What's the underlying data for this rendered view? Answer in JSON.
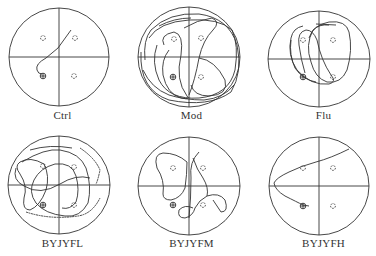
{
  "figure": {
    "type": "Morris water maze swim path diagrams",
    "style": {
      "stroke": "#333333",
      "background": "#ffffff"
    },
    "panels": [
      {
        "id": "ctrl",
        "label": "Ctrl",
        "row": 0,
        "col": 0
      },
      {
        "id": "mod",
        "label": "Mod",
        "row": 0,
        "col": 1
      },
      {
        "id": "flu",
        "label": "Flu",
        "row": 0,
        "col": 2
      },
      {
        "id": "byjyfl",
        "label": "BYJYFL",
        "row": 1,
        "col": 0
      },
      {
        "id": "byjyfm",
        "label": "BYJYFM",
        "row": 1,
        "col": 1
      },
      {
        "id": "byjyfh",
        "label": "BYJYFH",
        "row": 1,
        "col": 2
      }
    ],
    "markers": {
      "platform": "circle-with-cross (target platform, lower-left quadrant)",
      "start_points": "dashed small circles in other quadrants"
    }
  }
}
